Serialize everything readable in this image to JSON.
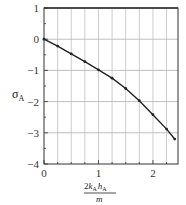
{
  "chart_data": {
    "type": "line",
    "title": "",
    "xlabel": "2k_A h_A / m",
    "xlabel_parts": {
      "numerator_prefix": "2",
      "k": "k",
      "k_sub": "A",
      "h": "h",
      "h_sub": "A",
      "denominator": "m"
    },
    "ylabel": "σ_A",
    "ylabel_parts": {
      "symbol": "σ",
      "sub": "A"
    },
    "xlim": [
      0,
      2.46
    ],
    "ylim": [
      -4,
      1
    ],
    "x_ticks": [
      0,
      1,
      2
    ],
    "x_tick_labels": [
      "0",
      "1",
      "2"
    ],
    "y_ticks": [
      1,
      0,
      -1,
      -2,
      -3,
      -4
    ],
    "y_tick_labels": [
      "1",
      "0",
      "−1",
      "−2",
      "−3",
      "−4"
    ],
    "x_gridlines": [
      0.25,
      0.5,
      0.75,
      1.0,
      1.25,
      1.5,
      1.75,
      2.0,
      2.25
    ],
    "y_gridlines": [
      0,
      -1,
      -2,
      -3
    ],
    "grid": true,
    "legend": null,
    "series": [
      {
        "name": "σA",
        "marker": "dot",
        "line_color": "#222222",
        "x": [
          0,
          0.25,
          0.5,
          0.75,
          1.0,
          1.25,
          1.5,
          1.75,
          2.0,
          2.25,
          2.4
        ],
        "values": [
          0,
          -0.22,
          -0.47,
          -0.72,
          -0.98,
          -1.25,
          -1.58,
          -1.97,
          -2.42,
          -2.88,
          -3.2
        ]
      }
    ]
  },
  "colors": {
    "grid": "#b8b8b8",
    "frame": "#333333",
    "line": "#222222"
  }
}
